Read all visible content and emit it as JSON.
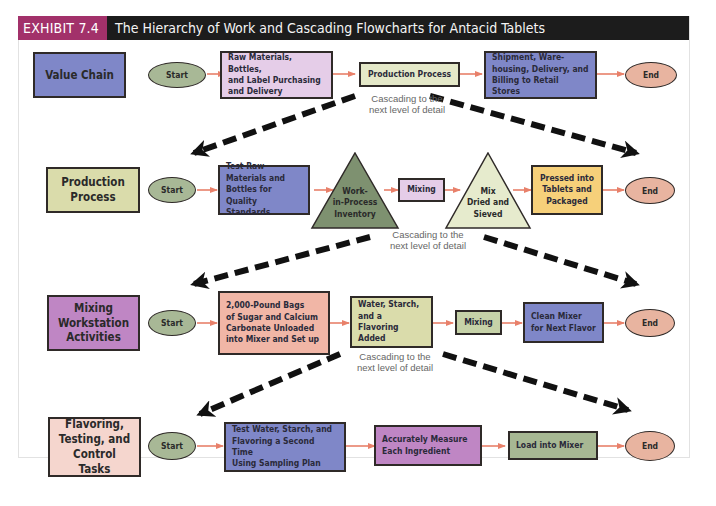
{
  "exhibit": {
    "tag": "EXHIBIT 7.4",
    "title": "The Hierarchy of Work and Cascading Flowcharts for Antacid Tablets",
    "colors": {
      "tag_bg": "#a2316a",
      "title_bg": "#1c1c1c",
      "arrow": "#e8806a"
    }
  },
  "cascade_label": "Cascading to the next level of detail",
  "cascade_lines": [
    "Cascading to the",
    "next level of detail"
  ],
  "levels": [
    {
      "label": "Value Chain",
      "start": "Start",
      "end": "End",
      "steps": [
        {
          "shape": "box",
          "text": "Raw Materials, Bottles, and Label Purchasing and Delivery"
        },
        {
          "shape": "box",
          "text": "Production Process"
        },
        {
          "shape": "box",
          "text": "Shipment, Warehousing, Delivery, and Billing to Retail Stores"
        }
      ]
    },
    {
      "label": "Production Process",
      "start": "Start",
      "end": "End",
      "steps": [
        {
          "shape": "box",
          "text": "Test Raw Materials and Bottles for Quality Standards"
        },
        {
          "shape": "triangle",
          "text": "Work-in-Process Inventory"
        },
        {
          "shape": "box",
          "text": "Mixing"
        },
        {
          "shape": "triangle",
          "text": "Mix Dried and Sieved"
        },
        {
          "shape": "box",
          "text": "Pressed into Tablets and Packaged"
        }
      ]
    },
    {
      "label": "Mixing Workstation Activities",
      "start": "Start",
      "end": "End",
      "steps": [
        {
          "shape": "box",
          "text": "2,000-Pound Bags of Sugar and Calcium Carbonate Unloaded into Mixer and Set up"
        },
        {
          "shape": "box",
          "text": "Water, Starch, and a Flavoring Added"
        },
        {
          "shape": "box",
          "text": "Mixing"
        },
        {
          "shape": "box",
          "text": "Clean Mixer for Next Flavor"
        }
      ]
    },
    {
      "label": "Flavoring, Testing, and Control Tasks",
      "start": "Start",
      "end": "End",
      "steps": [
        {
          "shape": "box",
          "text": "Test Water, Starch, and Flavoring a Second Time Using Sampling Plan"
        },
        {
          "shape": "box",
          "text": "Accurately Measure Each Ingredient"
        },
        {
          "shape": "box",
          "text": "Load into Mixer"
        }
      ]
    }
  ],
  "display": {
    "l1_label": "Value Chain",
    "l1_s1": [
      "Raw Materials, Bottles,",
      "and Label Purchasing",
      "and Delivery"
    ],
    "l1_s3": [
      "Shipment, Ware-",
      "housing, Delivery, and",
      "Billing to Retail Stores"
    ],
    "l2_label": [
      "Production",
      "Process"
    ],
    "l2_s1": [
      "Test Raw",
      "Materials and",
      "Bottles for",
      "Quality Standards"
    ],
    "l2_t1": [
      "Work-",
      "in-Process",
      "Inventory"
    ],
    "l2_t2": [
      "Mix",
      "Dried and",
      "Sieved"
    ],
    "l2_s5": [
      "Pressed into",
      "Tablets and",
      "Packaged"
    ],
    "l3_label": [
      "Mixing",
      "Workstation",
      "Activities"
    ],
    "l3_s1": [
      "2,000-Pound Bags",
      "of Sugar and Calcium",
      "Carbonate Unloaded",
      "into Mixer and Set up"
    ],
    "l3_s2": [
      "Water, Starch,",
      "and a Flavoring",
      "Added"
    ],
    "l3_s4": [
      "Clean Mixer",
      "for Next Flavor"
    ],
    "l4_label": [
      "Flavoring,",
      "Testing, and",
      "Control Tasks"
    ],
    "l4_s1": [
      "Test Water, Starch, and",
      "Flavoring a Second Time",
      "Using Sampling Plan"
    ],
    "l4_s2": [
      "Accurately Measure",
      "Each Ingredient"
    ]
  }
}
